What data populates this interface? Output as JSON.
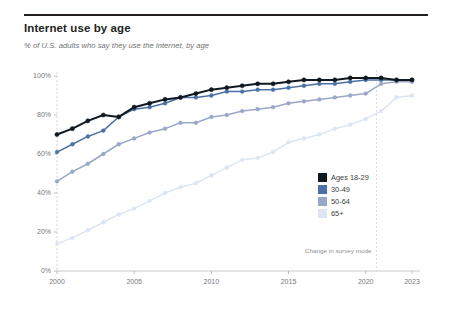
{
  "header": {
    "title": "Internet use by age",
    "subtitle": "% of U.S. adults who say they use the internet, by age"
  },
  "annotations": {
    "survey_mode_note": "Change in survey mode"
  },
  "legend": {
    "position": "inside-right",
    "entries": [
      {
        "label": "Ages 18-29",
        "color": "#101820"
      },
      {
        "label": "30-49",
        "color": "#4a72a6"
      },
      {
        "label": "50-64",
        "color": "#9aa8c8"
      },
      {
        "label": "65+",
        "color": "#dde5f2"
      }
    ]
  },
  "axis": {
    "y_ticks": [
      "100%",
      "80%",
      "60%",
      "40%",
      "20%",
      "0%"
    ],
    "x_ticks": [
      "2000",
      "2005",
      "2010",
      "2015",
      "2020",
      "2023"
    ]
  },
  "chart_data": {
    "type": "line",
    "title": "Internet use by age",
    "subtitle": "% of U.S. adults who say they use the internet, by age",
    "xlabel": "",
    "ylabel": "",
    "ylim": [
      0,
      100
    ],
    "xlim": [
      2000,
      2023
    ],
    "grid": false,
    "legend_position": "inside-right",
    "annotations": [
      {
        "text": "Change in survey mode",
        "x": 2021,
        "y": 8
      }
    ],
    "x": [
      2000,
      2001,
      2002,
      2003,
      2004,
      2005,
      2006,
      2007,
      2008,
      2009,
      2010,
      2011,
      2012,
      2013,
      2014,
      2015,
      2016,
      2017,
      2018,
      2019,
      2020,
      2021,
      2022,
      2023
    ],
    "series": [
      {
        "name": "Ages 18-29",
        "color": "#101820",
        "values": [
          70,
          73,
          77,
          80,
          79,
          84,
          86,
          88,
          89,
          91,
          93,
          94,
          95,
          96,
          96,
          97,
          98,
          98,
          98,
          99,
          99,
          99,
          98,
          98
        ]
      },
      {
        "name": "30-49",
        "color": "#4a72a6",
        "values": [
          61,
          65,
          69,
          72,
          79,
          83,
          84,
          86,
          89,
          89,
          90,
          92,
          92,
          93,
          93,
          94,
          95,
          96,
          96,
          97,
          98,
          98,
          98,
          98
        ]
      },
      {
        "name": "50-64",
        "color": "#9aa8c8",
        "values": [
          46,
          51,
          55,
          60,
          65,
          68,
          71,
          73,
          76,
          76,
          79,
          80,
          82,
          83,
          84,
          86,
          87,
          88,
          89,
          90,
          91,
          96,
          97,
          97
        ]
      },
      {
        "name": "65+",
        "color": "#dde5f2",
        "values": [
          14,
          17,
          21,
          25,
          29,
          32,
          36,
          40,
          43,
          45,
          49,
          53,
          57,
          58,
          61,
          66,
          68,
          70,
          73,
          75,
          78,
          82,
          89,
          90
        ]
      }
    ]
  }
}
